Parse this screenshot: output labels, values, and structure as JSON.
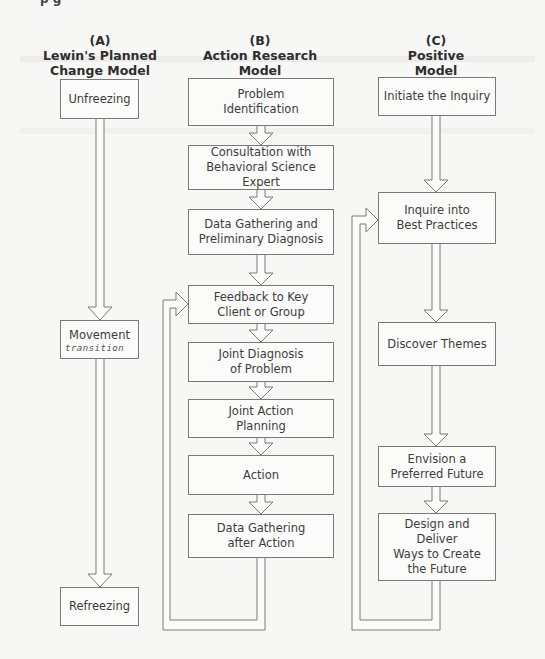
{
  "top_cutoff_text": "p                                g",
  "colors": {
    "line": "#7a7a7a",
    "box_fill": "#fbfbfa",
    "text": "#3d3d3d",
    "background": "#f7f7f5"
  },
  "columns": [
    {
      "id": "A",
      "label": "(A)",
      "title_line1": "Lewin's Planned",
      "title_line2": "Change Model",
      "steps": [
        {
          "text": "Unfreezing"
        },
        {
          "text": "Movement",
          "annotation": "transition"
        },
        {
          "text": "Refreezing"
        }
      ]
    },
    {
      "id": "B",
      "label": "(B)",
      "title_line1": "Action Research",
      "title_line2": "Model",
      "steps": [
        {
          "text": "Problem\nIdentification"
        },
        {
          "text": "Consultation with\nBehavioral Science Expert"
        },
        {
          "text": "Data Gathering and\nPreliminary Diagnosis"
        },
        {
          "text": "Feedback to Key\nClient or Group"
        },
        {
          "text": "Joint Diagnosis\nof Problem"
        },
        {
          "text": "Joint Action\nPlanning"
        },
        {
          "text": "Action"
        },
        {
          "text": "Data Gathering\nafter Action"
        }
      ],
      "loop": {
        "from": "Data Gathering after Action",
        "to": "Feedback to Key Client or Group"
      }
    },
    {
      "id": "C",
      "label": "(C)",
      "title_line1": "Positive",
      "title_line2": "Model",
      "steps": [
        {
          "text": "Initiate the Inquiry"
        },
        {
          "text": "Inquire into\nBest Practices"
        },
        {
          "text": "Discover Themes"
        },
        {
          "text": "Envision a\nPreferred Future"
        },
        {
          "text": "Design and Deliver\nWays to Create\nthe Future"
        }
      ],
      "loop": {
        "from": "Design and Deliver Ways to Create the Future",
        "to": "Inquire into Best Practices"
      }
    }
  ]
}
